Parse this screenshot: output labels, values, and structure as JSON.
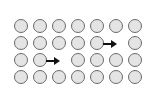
{
  "figure": {
    "type": "grid-diagram",
    "background_color": "#ffffff",
    "grid": {
      "rows": 4,
      "columns": 7,
      "origin_x": 14,
      "origin_y": 19,
      "col_spacing": 19,
      "row_spacing": 17
    },
    "node": {
      "name": "circle",
      "fill_color": "#e4e4e4",
      "stroke_color": "#6b6b6b",
      "diameter": 14
    },
    "arrow": {
      "name": "right-arrow",
      "color": "#111111",
      "direction": "right"
    },
    "cells": [
      {
        "row": 0,
        "col": 0,
        "kind": "circle"
      },
      {
        "row": 0,
        "col": 1,
        "kind": "circle"
      },
      {
        "row": 0,
        "col": 2,
        "kind": "circle"
      },
      {
        "row": 0,
        "col": 3,
        "kind": "circle"
      },
      {
        "row": 0,
        "col": 4,
        "kind": "circle"
      },
      {
        "row": 0,
        "col": 5,
        "kind": "circle"
      },
      {
        "row": 0,
        "col": 6,
        "kind": "circle"
      },
      {
        "row": 1,
        "col": 0,
        "kind": "circle"
      },
      {
        "row": 1,
        "col": 1,
        "kind": "circle"
      },
      {
        "row": 1,
        "col": 2,
        "kind": "circle"
      },
      {
        "row": 1,
        "col": 3,
        "kind": "circle"
      },
      {
        "row": 1,
        "col": 4,
        "kind": "circle-with-arrow"
      },
      {
        "row": 1,
        "col": 5,
        "kind": "empty"
      },
      {
        "row": 1,
        "col": 6,
        "kind": "circle"
      },
      {
        "row": 2,
        "col": 0,
        "kind": "circle"
      },
      {
        "row": 2,
        "col": 1,
        "kind": "circle-with-arrow"
      },
      {
        "row": 2,
        "col": 2,
        "kind": "empty"
      },
      {
        "row": 2,
        "col": 3,
        "kind": "circle"
      },
      {
        "row": 2,
        "col": 4,
        "kind": "circle"
      },
      {
        "row": 2,
        "col": 5,
        "kind": "circle"
      },
      {
        "row": 2,
        "col": 6,
        "kind": "circle"
      },
      {
        "row": 3,
        "col": 0,
        "kind": "circle"
      },
      {
        "row": 3,
        "col": 1,
        "kind": "circle"
      },
      {
        "row": 3,
        "col": 2,
        "kind": "circle"
      },
      {
        "row": 3,
        "col": 3,
        "kind": "circle"
      },
      {
        "row": 3,
        "col": 4,
        "kind": "circle"
      },
      {
        "row": 3,
        "col": 5,
        "kind": "circle"
      },
      {
        "row": 3,
        "col": 6,
        "kind": "circle"
      }
    ]
  }
}
